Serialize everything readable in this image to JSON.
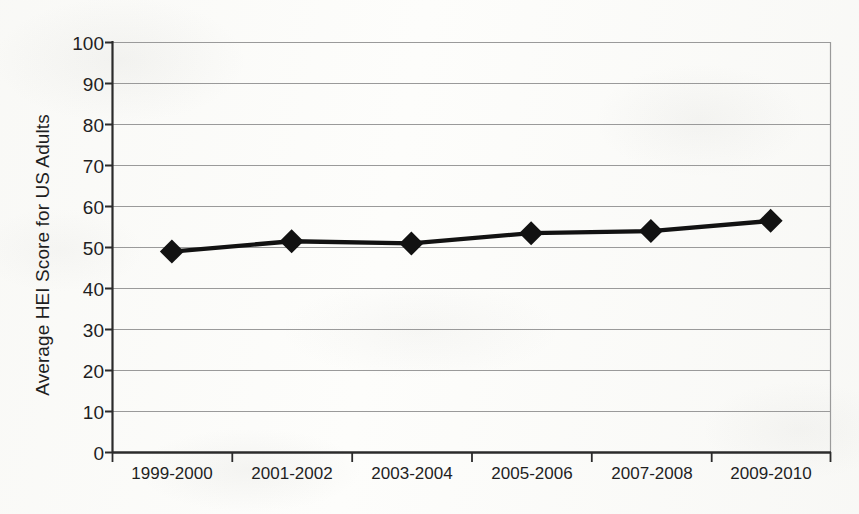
{
  "chart_data": {
    "type": "line",
    "title": "",
    "xlabel": "",
    "ylabel": "Average HEI Score for US Adults",
    "categories": [
      "1999-2000",
      "2001-2002",
      "2003-2004",
      "2005-2006",
      "2007-2008",
      "2009-2010"
    ],
    "series": [
      {
        "name": "Average HEI Score",
        "values": [
          49,
          51.5,
          51,
          53.5,
          54,
          56.5
        ]
      }
    ],
    "ylim": [
      0,
      100
    ],
    "yticks": [
      0,
      10,
      20,
      30,
      40,
      50,
      60,
      70,
      80,
      90,
      100
    ],
    "ytick_labels": [
      "0",
      "10",
      "20",
      "30",
      "40",
      "50",
      "60",
      "70",
      "80",
      "90",
      "100"
    ],
    "grid": true,
    "grid_axis": "y",
    "legend": false,
    "legend_position": "none",
    "marker": "diamond",
    "line_color": "#121212",
    "marker_color": "#121212",
    "grid_color": "#9a9a9a",
    "axis_color": "#2b2b2b",
    "background_color": "#fdfdfb"
  },
  "axis": {
    "y_label_text": "Average HEI Score for US Adults"
  }
}
